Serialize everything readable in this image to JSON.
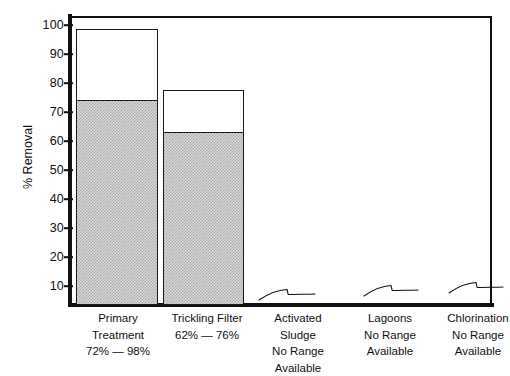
{
  "chart_data": {
    "type": "bar",
    "title": "",
    "xlabel": "",
    "ylabel": "% Removal",
    "ylim": [
      0,
      104
    ],
    "grid": false,
    "legend": "none",
    "yticks": [
      100,
      90,
      80,
      70,
      60,
      50,
      40,
      30,
      20,
      10
    ],
    "ytick_labels": [
      "100",
      "90",
      "80",
      "70",
      "60",
      "50",
      "40",
      "30",
      "20",
      "10"
    ],
    "categories": [
      "Primary Treatment",
      "Trickling Filter",
      "Activated Sludge",
      "Lagoons",
      "Chlorination"
    ],
    "series": [
      {
        "name": "Low end of range (shaded)",
        "values": [
          72,
          62,
          null,
          null,
          null
        ]
      },
      {
        "name": "High end of range (open)",
        "values": [
          98,
          76,
          null,
          null,
          null
        ]
      }
    ],
    "range_labels": [
      "72% — 98%",
      "62% — 76%",
      "No Range Available",
      "No Range Available",
      "No Range Available"
    ],
    "annotations": [
      "Activated Sludge: No Range Available",
      "Lagoons: No Range Available",
      "Chlorination: No Range Available"
    ]
  },
  "axis": {
    "y_label": "% Removal",
    "ticks": [
      {
        "value": "100",
        "y": 25
      },
      {
        "value": "90",
        "y": 54
      },
      {
        "value": "80",
        "y": 83
      },
      {
        "value": "70",
        "y": 112
      },
      {
        "value": "60",
        "y": 141
      },
      {
        "value": "50",
        "y": 170
      },
      {
        "value": "40",
        "y": 199
      },
      {
        "value": "30",
        "y": 228
      },
      {
        "value": "20",
        "y": 257
      },
      {
        "value": "10",
        "y": 286
      }
    ]
  },
  "bars": [
    {
      "name": "primary-treatment",
      "top_label": "98",
      "fill_label": "72",
      "x": 76,
      "width": 82,
      "top_y": 29,
      "fill_top_y": 101,
      "base_y": 305
    },
    {
      "name": "trickling-filter",
      "top_label": "76",
      "fill_label": "62",
      "x": 163,
      "width": 81,
      "top_y": 90,
      "fill_top_y": 133,
      "base_y": 305
    }
  ],
  "nodata_marks": [
    {
      "name": "activated-sludge-mark",
      "x": 257,
      "y": 282,
      "width": 60
    },
    {
      "name": "lagoons-mark",
      "x": 362,
      "y": 278,
      "width": 58
    },
    {
      "name": "chlorination-mark",
      "x": 447,
      "y": 275,
      "width": 58
    }
  ],
  "category_labels": [
    {
      "name": "primary-treatment",
      "x": 68,
      "y": 310,
      "width": 100,
      "lines": [
        "Primary",
        "Treatment",
        "72% — 98%"
      ]
    },
    {
      "name": "trickling-filter",
      "x": 157,
      "y": 310,
      "width": 100,
      "lines": [
        "Trickling Filter",
        "62% — 76%"
      ]
    },
    {
      "name": "activated-sludge",
      "x": 248,
      "y": 310,
      "width": 100,
      "lines": [
        "Activated",
        "Sludge",
        "No Range",
        "Available"
      ]
    },
    {
      "name": "lagoons",
      "x": 340,
      "y": 310,
      "width": 100,
      "lines": [
        "Lagoons",
        "No Range",
        "Available"
      ]
    },
    {
      "name": "chlorination",
      "x": 428,
      "y": 310,
      "width": 100,
      "lines": [
        "Chlorination",
        "No Range",
        "Available"
      ]
    }
  ],
  "colors": {
    "ink": "#111111",
    "bar_fill": "#d0d0d0",
    "bar_open": "#ffffff",
    "background": "#ffffff"
  }
}
